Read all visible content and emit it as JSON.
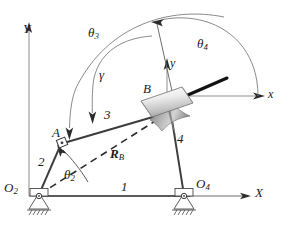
{
  "figure": {
    "kind": "fourbar-crank-slider-kinematic-diagram",
    "background_color": "#ffffff",
    "line_color": "#3c3c3c",
    "dark_link_color": "#111111",
    "slider_fill_light": "#f2f2f2",
    "slider_fill_dark": "#b9b9b9",
    "horn_fill": "#8e8e8e"
  },
  "axes": {
    "global": {
      "x_label": "X",
      "y_label": "Y",
      "origin_label": "O",
      "origin_sub": "2"
    },
    "local": {
      "x_label": "x",
      "y_label": "y"
    }
  },
  "joints": [
    {
      "name": "O2",
      "label": "O",
      "sub": "2",
      "type": "grounded-pivot"
    },
    {
      "name": "A",
      "label": "A",
      "sub": "",
      "type": "pin-joint"
    },
    {
      "name": "B",
      "label": "B",
      "sub": "",
      "type": "slider-joint"
    },
    {
      "name": "O4",
      "label": "O",
      "sub": "4",
      "type": "grounded-pivot"
    }
  ],
  "links": [
    {
      "id": "1",
      "label": "1",
      "name": "ground-link"
    },
    {
      "id": "2",
      "label": "2",
      "name": "crank-link"
    },
    {
      "id": "3",
      "label": "3",
      "name": "coupler-link"
    },
    {
      "id": "4",
      "label": "4",
      "name": "output-link"
    }
  ],
  "angles": [
    {
      "id": "theta2",
      "label": "θ",
      "sub": "2",
      "name": "crank-angle"
    },
    {
      "id": "theta3",
      "label": "θ",
      "sub": "3",
      "name": "coupler-angle"
    },
    {
      "id": "theta4",
      "label": "θ",
      "sub": "4",
      "name": "output-angle"
    },
    {
      "id": "gamma",
      "label": "γ",
      "sub": "",
      "name": "transmission-angle"
    }
  ],
  "vectors": [
    {
      "id": "RB",
      "label": "R",
      "sub": "B",
      "name": "position-vector-to-B"
    }
  ]
}
